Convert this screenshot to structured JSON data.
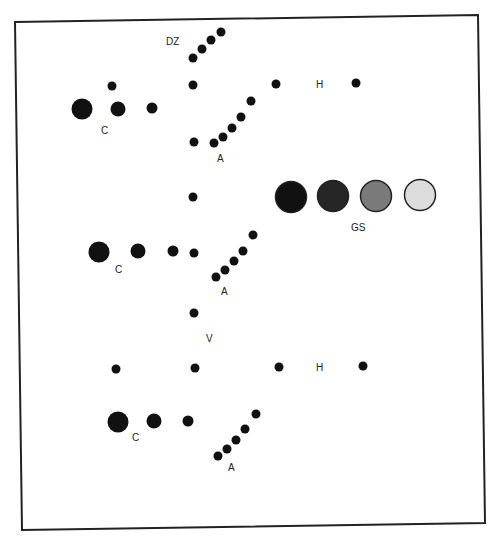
{
  "frame": {
    "corners": [
      [
        15,
        22
      ],
      [
        478,
        15
      ],
      [
        485,
        523
      ],
      [
        22,
        530
      ]
    ],
    "stroke": "#222222",
    "stroke_width": 2
  },
  "labels": {
    "dz": {
      "text": "DZ",
      "x": 166,
      "y": 45
    },
    "c1": {
      "text": "C",
      "x": 101,
      "y": 134
    },
    "a1": {
      "text": "A",
      "x": 217,
      "y": 162
    },
    "h1": {
      "text": "H",
      "x": 316,
      "y": 88
    },
    "gs": {
      "text": "GS",
      "x": 351,
      "y": 231
    },
    "c2": {
      "text": "C",
      "x": 115,
      "y": 273
    },
    "a2": {
      "text": "A",
      "x": 221,
      "y": 295
    },
    "v": {
      "text": "V",
      "x": 206,
      "y": 342
    },
    "h2": {
      "text": "H",
      "x": 316,
      "y": 371
    },
    "c3": {
      "text": "C",
      "x": 132,
      "y": 441
    },
    "a3": {
      "text": "A",
      "x": 228,
      "y": 471
    }
  },
  "dots": [
    {
      "group": "dz",
      "x": 193,
      "y": 58,
      "r": 4.5
    },
    {
      "group": "dz",
      "x": 202,
      "y": 49,
      "r": 4.5
    },
    {
      "group": "dz",
      "x": 211,
      "y": 40,
      "r": 4.5
    },
    {
      "group": "dz",
      "x": 221,
      "y": 32,
      "r": 4.5
    },
    {
      "group": "c1",
      "x": 82,
      "y": 109,
      "r": 10.5
    },
    {
      "group": "c1",
      "x": 118,
      "y": 109,
      "r": 7.5
    },
    {
      "group": "c1",
      "x": 152,
      "y": 108,
      "r": 5.5
    },
    {
      "group": "c1",
      "x": 112,
      "y": 86,
      "r": 4.5
    },
    {
      "group": "row1",
      "x": 193,
      "y": 85,
      "r": 4.5
    },
    {
      "group": "h1",
      "x": 276,
      "y": 84,
      "r": 4.5
    },
    {
      "group": "h1",
      "x": 356,
      "y": 83,
      "r": 4.5
    },
    {
      "group": "a1",
      "x": 194,
      "y": 142,
      "r": 4.5
    },
    {
      "group": "a1",
      "x": 214,
      "y": 143,
      "r": 4.5
    },
    {
      "group": "a1",
      "x": 223,
      "y": 137,
      "r": 4.5
    },
    {
      "group": "a1",
      "x": 232,
      "y": 128,
      "r": 4.5
    },
    {
      "group": "a1",
      "x": 241,
      "y": 117,
      "r": 4.5
    },
    {
      "group": "a1",
      "x": 251,
      "y": 101,
      "r": 4.5
    },
    {
      "group": "mid",
      "x": 193,
      "y": 197,
      "r": 4.5
    },
    {
      "group": "c2",
      "x": 99,
      "y": 252,
      "r": 10.5
    },
    {
      "group": "c2",
      "x": 138,
      "y": 251,
      "r": 7.5
    },
    {
      "group": "c2",
      "x": 173,
      "y": 251,
      "r": 5.5
    },
    {
      "group": "c2",
      "x": 194,
      "y": 253,
      "r": 4.5
    },
    {
      "group": "a2",
      "x": 216,
      "y": 277,
      "r": 4.5
    },
    {
      "group": "a2",
      "x": 225,
      "y": 270,
      "r": 4.5
    },
    {
      "group": "a2",
      "x": 234,
      "y": 261,
      "r": 4.5
    },
    {
      "group": "a2",
      "x": 243,
      "y": 251,
      "r": 4.5
    },
    {
      "group": "a2",
      "x": 253,
      "y": 235,
      "r": 4.5
    },
    {
      "group": "v",
      "x": 194,
      "y": 313,
      "r": 4.5
    },
    {
      "group": "row3",
      "x": 116,
      "y": 369,
      "r": 4.5
    },
    {
      "group": "row3",
      "x": 195,
      "y": 368,
      "r": 4.5
    },
    {
      "group": "h2",
      "x": 279,
      "y": 367,
      "r": 4.5
    },
    {
      "group": "h2",
      "x": 363,
      "y": 366,
      "r": 4.5
    },
    {
      "group": "c3",
      "x": 118,
      "y": 422,
      "r": 10.5
    },
    {
      "group": "c3",
      "x": 154,
      "y": 421,
      "r": 7.5
    },
    {
      "group": "c3",
      "x": 188,
      "y": 421,
      "r": 5.5
    },
    {
      "group": "a3",
      "x": 218,
      "y": 456,
      "r": 4.5
    },
    {
      "group": "a3",
      "x": 227,
      "y": 449,
      "r": 4.5
    },
    {
      "group": "a3",
      "x": 236,
      "y": 440,
      "r": 4.5
    },
    {
      "group": "a3",
      "x": 245,
      "y": 429,
      "r": 4.5
    },
    {
      "group": "a3",
      "x": 256,
      "y": 414,
      "r": 4.5
    }
  ],
  "grayscale_swatches": [
    {
      "x": 291,
      "y": 197,
      "r": 15.5,
      "fill": "#111111"
    },
    {
      "x": 333,
      "y": 196,
      "r": 15.5,
      "fill": "#262626"
    },
    {
      "x": 376,
      "y": 196,
      "r": 15.5,
      "fill": "#7a7a7a"
    },
    {
      "x": 420,
      "y": 195,
      "r": 15.5,
      "fill": "#dcdcdc"
    }
  ],
  "colors": {
    "dot": "#111111",
    "swatch_stroke": "#222222",
    "background": "#ffffff"
  }
}
